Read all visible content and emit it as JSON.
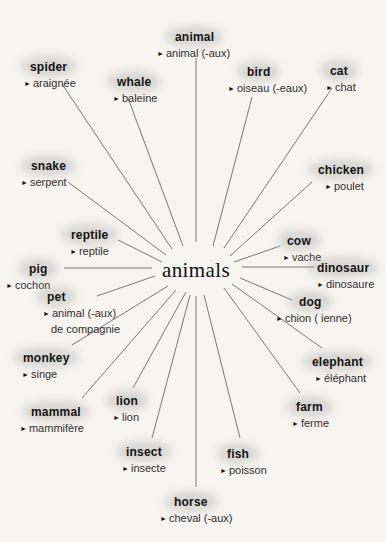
{
  "diagram": {
    "type": "radial-vocabulary-mind-map",
    "center_label": "animals",
    "bullet_marker": "►",
    "entries": [
      {
        "id": "animal",
        "word": "animal",
        "translations": [
          "animal (-aux)"
        ]
      },
      {
        "id": "spider",
        "word": "spider",
        "translations": [
          "araignée"
        ]
      },
      {
        "id": "whale",
        "word": "whale",
        "translations": [
          "baleine"
        ]
      },
      {
        "id": "bird",
        "word": "bird",
        "translations": [
          "oiseau (-eaux)"
        ]
      },
      {
        "id": "cat",
        "word": "cat",
        "translations": [
          "chat"
        ]
      },
      {
        "id": "snake",
        "word": "snake",
        "translations": [
          "serpent"
        ]
      },
      {
        "id": "chicken",
        "word": "chicken",
        "translations": [
          "poulet"
        ]
      },
      {
        "id": "reptile",
        "word": "reptile",
        "translations": [
          "reptile"
        ]
      },
      {
        "id": "cow",
        "word": "cow",
        "translations": [
          "vache"
        ]
      },
      {
        "id": "pig",
        "word": "pig",
        "translations": [
          "cochon"
        ]
      },
      {
        "id": "dinosaur",
        "word": "dinosaur",
        "translations": [
          "dinosaure"
        ]
      },
      {
        "id": "pet",
        "word": "pet",
        "translations": [
          "animal (-aux)",
          "de compagnie"
        ]
      },
      {
        "id": "dog",
        "word": "dog",
        "translations": [
          "chion ( ienne)"
        ]
      },
      {
        "id": "monkey",
        "word": "monkey",
        "translations": [
          "singe"
        ]
      },
      {
        "id": "elephant",
        "word": "elephant",
        "translations": [
          "éléphant"
        ]
      },
      {
        "id": "mammal",
        "word": "mammal",
        "translations": [
          "mammifère"
        ]
      },
      {
        "id": "lion",
        "word": "lion",
        "translations": [
          "lion"
        ]
      },
      {
        "id": "farm",
        "word": "farm",
        "translations": [
          "ferme"
        ]
      },
      {
        "id": "insect",
        "word": "insect",
        "translations": [
          "insecte"
        ]
      },
      {
        "id": "fish",
        "word": "fish",
        "translations": [
          "poisson"
        ]
      },
      {
        "id": "horse",
        "word": "horse",
        "translations": [
          "cheval (-aux)"
        ]
      }
    ],
    "colors": {
      "paper": "#f6f5f1",
      "ink": "#141414",
      "translation_ink": "#2e2e2e",
      "line": "#4f4f4f",
      "highlight": "#a8a8a8"
    }
  }
}
